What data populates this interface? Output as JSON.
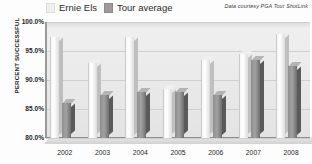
{
  "legend": {
    "entries": [
      {
        "label": "Ernie Els",
        "color": "#efefef",
        "swatch": "els-swatch"
      },
      {
        "label": "Tour average",
        "color": "#9b9b9b",
        "swatch": "tour-swatch"
      }
    ]
  },
  "credit": "Data courtesy PGA Tour ShotLink",
  "chart_data": {
    "type": "bar",
    "title": "",
    "subtitle": "",
    "xlabel": "",
    "ylabel": "PERCENT SUCCESSFUL",
    "categories": [
      "2002",
      "2003",
      "2004",
      "2005",
      "2006",
      "2007",
      "2008"
    ],
    "series": [
      {
        "name": "Ernie Els",
        "color": "#efefef",
        "values": [
          97.5,
          93.0,
          97.5,
          88.5,
          93.5,
          94.5,
          98.0
        ]
      },
      {
        "name": "Tour average",
        "color": "#9b9b9b",
        "values": [
          86.0,
          87.5,
          88.0,
          88.0,
          87.5,
          93.5,
          92.5
        ]
      }
    ],
    "ylim": [
      80.0,
      100.0
    ],
    "ytick_labels": [
      "100.0%",
      "95.0%",
      "90.0%",
      "85.0%",
      "80.0%"
    ],
    "ytick_values": [
      100.0,
      95.0,
      90.0,
      85.0,
      80.0
    ],
    "grid": true,
    "legend_position": "top-left",
    "annotations": [
      "Data courtesy PGA Tour ShotLink"
    ],
    "style": "3d-columns"
  }
}
